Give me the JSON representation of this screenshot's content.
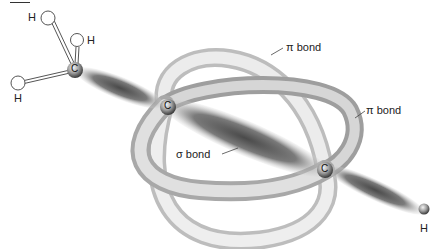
{
  "figure": {
    "labels": {
      "pi_bond_top": "π bond",
      "pi_bond_right": "π bond",
      "sigma_bond": "σ bond"
    },
    "atoms": {
      "carbon_methyl": "C",
      "carbon_center": "C",
      "carbon_right": "C",
      "h_top_left": "H",
      "h_top_right": "H",
      "h_left": "H",
      "h_bottom_right": "H"
    }
  }
}
